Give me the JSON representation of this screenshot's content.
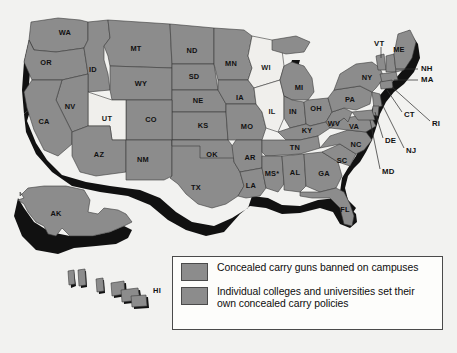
{
  "map": {
    "title": "United States concealed carry on campus map",
    "background_color": "#f2f2f0",
    "colors": {
      "banned": "#8c8c8c",
      "institution_choice": "#8c8c8c",
      "light_state": "#f0efec",
      "extrusion_shadow": "#111111",
      "border": "#3a3a3a",
      "label_text": "#111111"
    },
    "states": [
      {
        "code": "WA",
        "x": 65,
        "y": 33,
        "fill": "banned"
      },
      {
        "code": "OR",
        "x": 46,
        "y": 63,
        "fill": "banned"
      },
      {
        "code": "ID",
        "x": 93,
        "y": 70,
        "fill": "banned"
      },
      {
        "code": "MT",
        "x": 136,
        "y": 49,
        "fill": "banned"
      },
      {
        "code": "ND",
        "x": 192,
        "y": 51,
        "fill": "banned"
      },
      {
        "code": "MN",
        "x": 231,
        "y": 64,
        "fill": "banned"
      },
      {
        "code": "SD",
        "x": 194,
        "y": 77,
        "fill": "banned"
      },
      {
        "code": "WY",
        "x": 141,
        "y": 84,
        "fill": "banned"
      },
      {
        "code": "NV",
        "x": 70,
        "y": 107,
        "fill": "banned"
      },
      {
        "code": "CA",
        "x": 44,
        "y": 122,
        "fill": "banned"
      },
      {
        "code": "UT",
        "x": 107,
        "y": 119,
        "fill": "light_state"
      },
      {
        "code": "CO",
        "x": 151,
        "y": 120,
        "fill": "banned"
      },
      {
        "code": "NE",
        "x": 198,
        "y": 101,
        "fill": "banned"
      },
      {
        "code": "IA",
        "x": 240,
        "y": 98,
        "fill": "banned"
      },
      {
        "code": "KS",
        "x": 203,
        "y": 126,
        "fill": "banned"
      },
      {
        "code": "MO",
        "x": 247,
        "y": 127,
        "fill": "banned"
      },
      {
        "code": "WI",
        "x": 266,
        "y": 68,
        "fill": "light_state"
      },
      {
        "code": "IL",
        "x": 272,
        "y": 112,
        "fill": "light_state"
      },
      {
        "code": "MI",
        "x": 299,
        "y": 88,
        "fill": "banned"
      },
      {
        "code": "IN",
        "x": 293,
        "y": 112,
        "fill": "banned"
      },
      {
        "code": "OH",
        "x": 316,
        "y": 109,
        "fill": "banned"
      },
      {
        "code": "PA",
        "x": 350,
        "y": 100,
        "fill": "banned"
      },
      {
        "code": "NY",
        "x": 367,
        "y": 78,
        "fill": "banned"
      },
      {
        "code": "WV",
        "x": 334,
        "y": 124,
        "fill": "banned"
      },
      {
        "code": "VA",
        "x": 354,
        "y": 127,
        "fill": "banned"
      },
      {
        "code": "KY",
        "x": 307,
        "y": 131,
        "fill": "banned"
      },
      {
        "code": "TN",
        "x": 295,
        "y": 148,
        "fill": "banned"
      },
      {
        "code": "NC",
        "x": 356,
        "y": 145,
        "fill": "banned"
      },
      {
        "code": "SC",
        "x": 342,
        "y": 161,
        "fill": "banned"
      },
      {
        "code": "GA",
        "x": 324,
        "y": 174,
        "fill": "banned"
      },
      {
        "code": "AL",
        "x": 295,
        "y": 173,
        "fill": "banned"
      },
      {
        "code": "MS*",
        "x": 272,
        "y": 174,
        "fill": "banned"
      },
      {
        "code": "AR",
        "x": 250,
        "y": 158,
        "fill": "banned"
      },
      {
        "code": "LA",
        "x": 251,
        "y": 186,
        "fill": "banned"
      },
      {
        "code": "OK",
        "x": 212,
        "y": 155,
        "fill": "banned"
      },
      {
        "code": "TX",
        "x": 196,
        "y": 188,
        "fill": "banned"
      },
      {
        "code": "NM",
        "x": 143,
        "y": 160,
        "fill": "banned"
      },
      {
        "code": "AZ",
        "x": 99,
        "y": 155,
        "fill": "banned"
      },
      {
        "code": "FL",
        "x": 345,
        "y": 210,
        "fill": "banned"
      },
      {
        "code": "ME",
        "x": 399,
        "y": 50,
        "fill": "banned"
      },
      {
        "code": "AK",
        "x": 56,
        "y": 214,
        "fill": "banned"
      },
      {
        "code": "HI",
        "x": 157,
        "y": 291,
        "fill": "banned"
      }
    ],
    "callouts": [
      {
        "code": "VT",
        "x": 374,
        "y": 44,
        "line": [
          [
            381,
            47
          ],
          [
            381,
            58
          ]
        ]
      },
      {
        "code": "NH",
        "x": 421,
        "y": 69,
        "line": [
          [
            418,
            69
          ],
          [
            396,
            69
          ]
        ]
      },
      {
        "code": "MA",
        "x": 421,
        "y": 80,
        "line": [
          [
            418,
            80
          ],
          [
            394,
            80
          ]
        ]
      },
      {
        "code": "CT",
        "x": 404,
        "y": 115,
        "line": [
          [
            402,
            112
          ],
          [
            387,
            90
          ]
        ]
      },
      {
        "code": "RI",
        "x": 432,
        "y": 124,
        "line": [
          [
            430,
            121
          ],
          [
            392,
            87
          ]
        ]
      },
      {
        "code": "NJ",
        "x": 406,
        "y": 151,
        "line": [
          [
            404,
            148
          ],
          [
            382,
            104
          ]
        ]
      },
      {
        "code": "DE",
        "x": 385,
        "y": 141,
        "line": [
          [
            383,
            138
          ],
          [
            375,
            112
          ]
        ]
      },
      {
        "code": "MD",
        "x": 382,
        "y": 172,
        "line": [
          [
            380,
            169
          ],
          [
            370,
            120
          ]
        ]
      }
    ]
  },
  "legend": {
    "entries": [
      {
        "swatch_color": "#8c8c8c",
        "label": "Concealed carry guns banned on campuses"
      },
      {
        "swatch_color": "#8c8c8c",
        "label": "Individual colleges and universities set their own concealed carry policies"
      }
    ]
  }
}
